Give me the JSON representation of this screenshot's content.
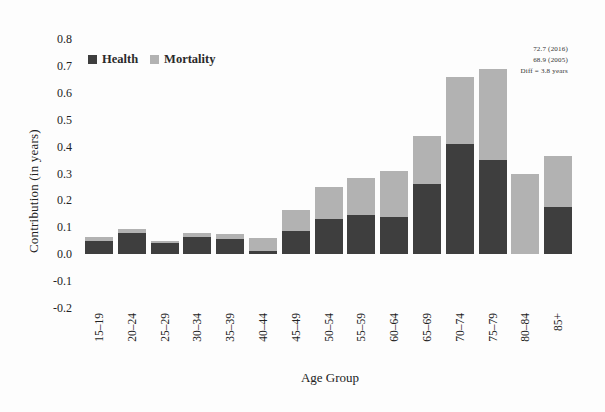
{
  "chart_data": {
    "type": "bar",
    "stacked": true,
    "xlabel": "Age Group",
    "ylabel": "Contribution (in years)",
    "ylim": [
      -0.2,
      0.8
    ],
    "ytick_labels": [
      "0.8",
      "0.7",
      "0.6",
      "0.5",
      "0.4",
      "0.3",
      "0.2",
      "0.1",
      "0.0",
      "-0.1",
      "-0.2"
    ],
    "grid": false,
    "legend_position": "top-left-inside",
    "categories": [
      "15–19",
      "20–24",
      "25–29",
      "30–34",
      "35–39",
      "40–44",
      "45–49",
      "50–54",
      "55–59",
      "60–64",
      "65–69",
      "70–74",
      "75–79",
      "80–84",
      "85+"
    ],
    "series": [
      {
        "name": "Health",
        "color": "#3e3e3e",
        "values": [
          0.05,
          0.08,
          0.04,
          0.065,
          0.055,
          0.01,
          0.085,
          0.13,
          0.145,
          0.14,
          0.26,
          0.41,
          0.35,
          0.0,
          0.175
        ]
      },
      {
        "name": "Mortality",
        "color": "#b2b2b2",
        "values": [
          0.015,
          0.015,
          0.01,
          0.015,
          0.02,
          0.05,
          0.08,
          0.12,
          0.14,
          0.17,
          0.18,
          0.25,
          0.34,
          0.3,
          0.19
        ]
      }
    ],
    "annotation_lines": [
      "72.7 (2016)",
      "68.9 (2005)",
      "Diff = 3.8 years"
    ]
  }
}
